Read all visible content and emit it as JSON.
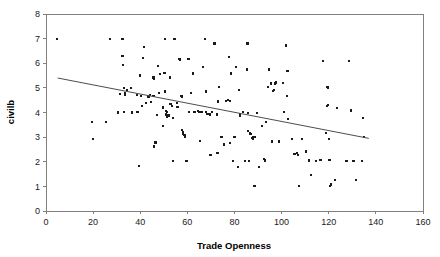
{
  "chart_data": {
    "type": "scatter",
    "title": "",
    "xlabel": "Trade Openness",
    "ylabel": "civilb",
    "xlim": [
      0,
      160
    ],
    "ylim": [
      0,
      8
    ],
    "xticks": [
      0,
      20,
      40,
      60,
      80,
      100,
      120,
      140,
      160
    ],
    "yticks": [
      0,
      1,
      2,
      3,
      4,
      5,
      6,
      7,
      8
    ],
    "grid": false,
    "legend": null,
    "marker_style": "small-filled-square",
    "marker_color": "#1a1a1a",
    "trend_line": {
      "type": "linear-fit",
      "color": "#4d4d4d",
      "x_start": 5,
      "y_start": 5.4,
      "x_end": 137,
      "y_end": 2.95,
      "slope": -0.01856,
      "intercept": 5.493
    },
    "points": [
      [
        4.5,
        7.0
      ],
      [
        19.5,
        3.6
      ],
      [
        19.8,
        2.93
      ],
      [
        25.5,
        3.6
      ],
      [
        27.0,
        7.0
      ],
      [
        30.5,
        4.0
      ],
      [
        32.5,
        7.0
      ],
      [
        32.5,
        6.3
      ],
      [
        32.7,
        5.93
      ],
      [
        33.0,
        4.98
      ],
      [
        33.4,
        4.78
      ],
      [
        33.6,
        4.72
      ],
      [
        33.2,
        4.02
      ],
      [
        36.5,
        4.0
      ],
      [
        38.5,
        4.72
      ],
      [
        38.8,
        4.02
      ],
      [
        39.5,
        1.84
      ],
      [
        40.0,
        5.5
      ],
      [
        40.3,
        4.68
      ],
      [
        40.6,
        4.25
      ],
      [
        41.5,
        6.65
      ],
      [
        41.3,
        6.22
      ],
      [
        44.5,
        4.42
      ],
      [
        45.5,
        5.42
      ],
      [
        45.8,
        5.38
      ],
      [
        46.0,
        5.42
      ],
      [
        45.6,
        4.68
      ],
      [
        45.9,
        2.62
      ],
      [
        46.5,
        2.78
      ],
      [
        47.5,
        5.9
      ],
      [
        47.8,
        4.78
      ],
      [
        48.5,
        5.55
      ],
      [
        49.5,
        4.2
      ],
      [
        49.8,
        3.45
      ],
      [
        50.5,
        7.0
      ],
      [
        50.3,
        5.62
      ],
      [
        50.6,
        4.85
      ],
      [
        50.8,
        4.05
      ],
      [
        51.0,
        3.92
      ],
      [
        51.2,
        3.82
      ],
      [
        51.5,
        4.02
      ],
      [
        52.5,
        5.42
      ],
      [
        52.8,
        4.35
      ],
      [
        53.5,
        4.28
      ],
      [
        53.8,
        2.02
      ],
      [
        54.5,
        7.0
      ],
      [
        55.5,
        4.4
      ],
      [
        55.8,
        4.22
      ],
      [
        56.5,
        6.18
      ],
      [
        56.8,
        6.15
      ],
      [
        57.5,
        4.68
      ],
      [
        57.8,
        4.65
      ],
      [
        57.6,
        3.28
      ],
      [
        58.0,
        3.22
      ],
      [
        58.3,
        3.15
      ],
      [
        58.8,
        3.08
      ],
      [
        59.0,
        3.02
      ],
      [
        59.5,
        2.02
      ],
      [
        60.5,
        6.18
      ],
      [
        60.8,
        4.02
      ],
      [
        61.5,
        4.78
      ],
      [
        62.5,
        5.58
      ],
      [
        64.5,
        4.05
      ],
      [
        64.8,
        4.02
      ],
      [
        65.5,
        2.85
      ],
      [
        66.5,
        5.85
      ],
      [
        67.5,
        7.0
      ],
      [
        67.8,
        4.85
      ],
      [
        68.5,
        3.95
      ],
      [
        69.5,
        3.92
      ],
      [
        69.8,
        2.28
      ],
      [
        71.5,
        6.8
      ],
      [
        72.5,
        3.92
      ],
      [
        72.8,
        2.35
      ],
      [
        73.5,
        5.05
      ],
      [
        74.5,
        3.02
      ],
      [
        76.5,
        4.48
      ],
      [
        77.5,
        6.25
      ],
      [
        77.3,
        4.52
      ],
      [
        78.5,
        5.58
      ],
      [
        78.2,
        2.75
      ],
      [
        79.5,
        2.02
      ],
      [
        80.5,
        5.85
      ],
      [
        81.5,
        1.78
      ],
      [
        82.0,
        4.92
      ],
      [
        82.3,
        3.95
      ],
      [
        82.5,
        3.88
      ],
      [
        84.5,
        2.02
      ],
      [
        85.5,
        6.8
      ],
      [
        85.3,
        5.75
      ],
      [
        85.6,
        3.98
      ],
      [
        85.8,
        3.25
      ],
      [
        86.5,
        3.18
      ],
      [
        86.8,
        3.12
      ],
      [
        87.5,
        2.95
      ],
      [
        87.8,
        2.92
      ],
      [
        88.0,
        3.02
      ],
      [
        88.5,
        1.02
      ],
      [
        90.5,
        1.78
      ],
      [
        91.5,
        3.45
      ],
      [
        92.5,
        2.12
      ],
      [
        92.8,
        2.05
      ],
      [
        93.5,
        3.62
      ],
      [
        94.5,
        5.75
      ],
      [
        94.2,
        5.05
      ],
      [
        95.5,
        5.18
      ],
      [
        95.8,
        2.82
      ],
      [
        96.5,
        4.88
      ],
      [
        96.8,
        4.92
      ],
      [
        97.5,
        5.22
      ],
      [
        97.2,
        5.18
      ],
      [
        102.0,
        6.72
      ],
      [
        102.5,
        5.68
      ],
      [
        102.3,
        4.68
      ],
      [
        102.6,
        3.75
      ],
      [
        104.5,
        2.92
      ],
      [
        106.5,
        2.35
      ],
      [
        106.8,
        2.28
      ],
      [
        107.5,
        1.02
      ],
      [
        108.5,
        2.92
      ],
      [
        110.5,
        2.42
      ],
      [
        112.5,
        1.45
      ],
      [
        114.5,
        2.02
      ],
      [
        117.5,
        6.08
      ],
      [
        119.5,
        5.02
      ],
      [
        119.8,
        4.98
      ],
      [
        119.6,
        4.32
      ],
      [
        119.3,
        4.25
      ],
      [
        120.0,
        2.92
      ],
      [
        120.3,
        2.08
      ],
      [
        120.5,
        1.02
      ],
      [
        120.8,
        1.08
      ],
      [
        122.5,
        1.25
      ],
      [
        123.5,
        4.18
      ],
      [
        119.0,
        3.18
      ],
      [
        128.5,
        6.08
      ],
      [
        129.5,
        4.08
      ],
      [
        130.5,
        2.02
      ],
      [
        131.5,
        1.25
      ],
      [
        134.5,
        3.78
      ],
      [
        134.8,
        3.02
      ],
      [
        134.2,
        2.02
      ],
      [
        36.0,
        5.0
      ],
      [
        43.5,
        4.65
      ],
      [
        54.0,
        3.78
      ],
      [
        63.0,
        4.02
      ],
      [
        70.5,
        4.02
      ],
      [
        75.5,
        2.7
      ],
      [
        83.5,
        4.02
      ],
      [
        89.5,
        3.98
      ],
      [
        99.0,
        2.82
      ],
      [
        101.0,
        4.02
      ],
      [
        34.5,
        4.9
      ],
      [
        42.5,
        4.4
      ],
      [
        47.0,
        3.9
      ],
      [
        52.0,
        3.88
      ],
      [
        59.8,
        2.02
      ],
      [
        66.0,
        4.02
      ],
      [
        73.0,
        4.45
      ],
      [
        80.0,
        3.02
      ],
      [
        86.0,
        2.02
      ],
      [
        93.0,
        2.08
      ],
      [
        100.5,
        5.2
      ],
      [
        105.5,
        2.3
      ],
      [
        111.5,
        2.05
      ],
      [
        116.5,
        2.08
      ],
      [
        127.5,
        2.02
      ],
      [
        31.5,
        4.75
      ],
      [
        44.0,
        4.7
      ],
      [
        56.0,
        4.22
      ],
      [
        68.0,
        4.02
      ],
      [
        78.0,
        4.48
      ],
      [
        88.8,
        3.0
      ],
      [
        96.0,
        2.85
      ]
    ]
  },
  "axes": {
    "x_title": "Trade Openness",
    "y_title": "civilb"
  }
}
